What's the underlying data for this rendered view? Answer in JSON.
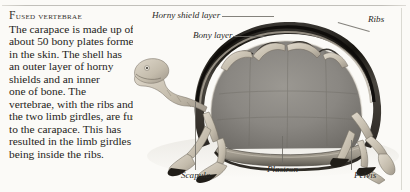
{
  "page": {
    "width": 410,
    "height": 192,
    "background_color": "#fbfaf7",
    "text_color": "#242320",
    "rule_color": "#b7b5af"
  },
  "article": {
    "heading": "Fused vertebrae",
    "heading_initial": "F",
    "heading_rest": "used vertebrae",
    "body_lines": [
      "The carapace is made up of",
      "about 50 bony plates formed",
      "in the skin. The shell has",
      "an outer layer of horny",
      "shields and an inner",
      "one of bone. The",
      "vertebrae, with the ribs and",
      "the two limb girdles, are fused",
      "to the carapace. This has",
      "resulted in the limb girdles",
      "being inside the ribs."
    ],
    "body_text": "The carapace is made up of about 50 bony plates formed in the skin. The shell has an outer layer of horny shields and an inner one of bone. The vertebrae, with the ribs and the two limb girdles, are fused to the carapace. This has resulted in the limb girdles being inside the ribs."
  },
  "illustration": {
    "subject": "tortoise-skeleton-cross-section",
    "description": "Cutaway photograph of a tortoise skeleton showing the interior of the carapace",
    "shell_interior_color": "#8a8782",
    "shell_rim_color": "#1c1a18",
    "bone_color": "#cfc8bb"
  },
  "labels": [
    {
      "id": "horny-shield-layer",
      "text": "Horny shield layer"
    },
    {
      "id": "bony-layer",
      "text": "Bony layer"
    },
    {
      "id": "ribs",
      "text": "Ribs"
    },
    {
      "id": "scapula",
      "text": "Scapula"
    },
    {
      "id": "plastron",
      "text": "Plastron"
    },
    {
      "id": "pelvis",
      "text": "Pelvis"
    }
  ]
}
